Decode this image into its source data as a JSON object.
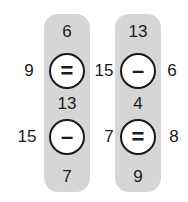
{
  "columns": [
    {
      "top": "6",
      "problems": [
        {
          "left": "9",
          "operator": "=",
          "operator_name": "equals",
          "right": ""
        },
        {
          "left": "15",
          "operator": "–",
          "operator_name": "minus",
          "right": ""
        }
      ],
      "middle": "13",
      "bottom": "7"
    },
    {
      "top": "13",
      "problems": [
        {
          "left": "15",
          "operator": "–",
          "operator_name": "minus",
          "right": "6"
        },
        {
          "left": "7",
          "operator": "=",
          "operator_name": "equals",
          "right": "8"
        }
      ],
      "middle": "4",
      "bottom": "9"
    }
  ],
  "colors": {
    "pill": "#d6d6d6",
    "stroke": "#1a1a1a",
    "background": "#ffffff"
  }
}
